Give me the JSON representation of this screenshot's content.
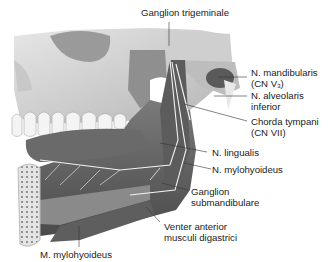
{
  "figure": {
    "labels": {
      "ganglion_trigeminale": "Ganglion trigeminale",
      "n_mandibularis_1": "N. mandibularis",
      "n_mandibularis_2a": "(CN V",
      "n_mandibularis_sub": "3",
      "n_mandibularis_2b": ")",
      "n_alveolaris_1": "N. alveolaris",
      "n_alveolaris_2": "inferior",
      "chorda_1": "Chorda tympani",
      "chorda_2": "(CN VII)",
      "n_lingualis": "N. lingualis",
      "n_mylohyoideus": "N. mylohyoideus",
      "ganglion_sub_1": "Ganglion",
      "ganglion_sub_2": "submandibulare",
      "venter_1": "Venter anterior",
      "venter_2": "musculi digastrici",
      "m_mylohyoideus": "M. mylohyoideus"
    },
    "colors": {
      "bone": "#d9d9d9",
      "bone_shadow": "#a8a8a8",
      "muscle": "#6e6e6e",
      "nerve": "#f2f2f2",
      "leader": "#333333"
    }
  }
}
